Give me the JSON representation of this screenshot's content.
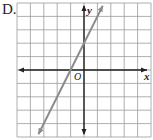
{
  "option_label": "D.",
  "graph": {
    "x_axis_label": "x",
    "y_axis_label": "y",
    "origin_label": "O",
    "grid": {
      "x_min": -5,
      "x_max": 5,
      "y_min": -5,
      "y_max": 5
    },
    "line": {
      "slope": 2,
      "intercept": 2,
      "color": "#8c8c8c"
    }
  }
}
